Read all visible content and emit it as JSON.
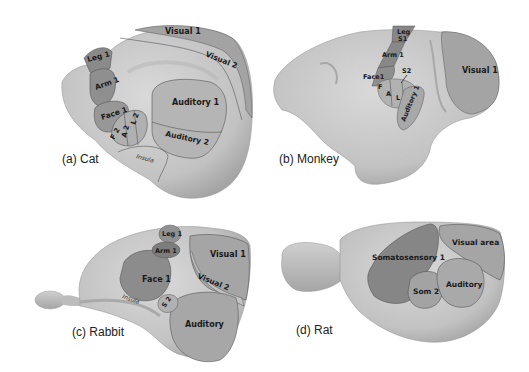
{
  "panels": [
    {
      "id": "a",
      "caption": "(a) Cat",
      "regions": {
        "visual1": "Visual 1",
        "visual2": "Visual 2",
        "leg1": "Leg 1",
        "arm1": "Arm 1",
        "face1": "Face 1",
        "auditory1": "Auditory 1",
        "auditory2": "Auditory 2",
        "f2": "F 2",
        "a2": "A 2",
        "l2": "L 2",
        "insula": "Insula"
      }
    },
    {
      "id": "b",
      "caption": "(b) Monkey",
      "regions": {
        "leg": "Leg",
        "s1": "S1",
        "arm1": "Arm 1",
        "face1": "Face1",
        "s2": "S2",
        "f": "F",
        "a": "A",
        "l": "L",
        "auditory1": "Auditory 1",
        "visual1": "Visual 1"
      }
    },
    {
      "id": "c",
      "caption": "(c) Rabbit",
      "regions": {
        "leg1": "Leg 1",
        "arm1": "Arm 1",
        "face1": "Face 1",
        "visual1": "Visual 1",
        "visual2": "Visual 2",
        "s2": "S 2",
        "insula": "Insula",
        "auditory": "Auditory"
      }
    },
    {
      "id": "d",
      "caption": "(d) Rat",
      "regions": {
        "somatosensory1": "Somatosensory 1",
        "visual_area": "Visual area",
        "som2": "Som 2",
        "auditory": "Auditory"
      }
    }
  ],
  "colors": {
    "brain": "#c8c8c8",
    "brain_dark": "#a9a9a9",
    "region_light": "#b4b4b4",
    "region_mid": "#9a9a9a",
    "region_dark": "#838383",
    "region_darker": "#727272"
  }
}
